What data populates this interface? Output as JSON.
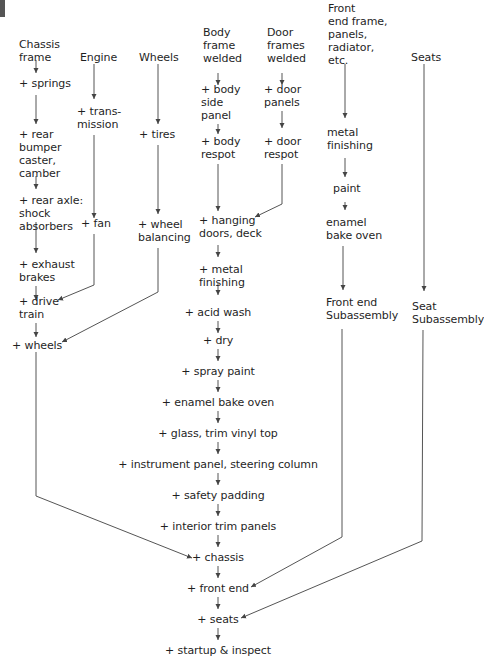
{
  "diagram": {
    "title_mark": "",
    "colors": {
      "line": "#555555",
      "text": "#1f1f1f",
      "background": "#ffffff"
    },
    "columns": {
      "chassis": {
        "header": "Chassis\nframe",
        "steps": [
          "+ springs",
          "+ rear\nbumper\ncaster,\ncamber",
          "+ rear axle:\nshock\nabsorbers",
          "+ exhaust\nbrakes",
          "+ drive\ntrain",
          "+ wheels"
        ]
      },
      "engine": {
        "header": "Engine",
        "steps": [
          "+ trans-\nmission",
          "+ fan"
        ]
      },
      "wheels": {
        "header": "Wheels",
        "steps": [
          "+ tires",
          "+ wheel\nbalancing"
        ]
      },
      "body": {
        "header": "Body\nframe\nwelded",
        "steps": [
          "+ body\nside\npanel",
          "+ body\nrespot"
        ]
      },
      "doors": {
        "header": "Door\nframes\nwelded",
        "steps": [
          "+ door\npanels",
          "+ door\nrespot"
        ]
      },
      "front_end": {
        "header": "Front\nend frame,\npanels,\nradiator,\netc.",
        "steps": [
          "metal\nfinishing",
          "paint",
          "enamel\nbake oven",
          "Front end\nSubassembly"
        ]
      },
      "seats": {
        "header": "Seats",
        "steps": [
          "Seat\nSubassembly"
        ]
      }
    },
    "main_line": [
      "+ hanging\ndoors, deck",
      "+ metal\nfinishing",
      "+ acid wash",
      "+ dry",
      "+ spray paint",
      "+ enamel bake oven",
      "+ glass, trim vinyl top",
      "+ instrument panel, steering column",
      "+ safety padding",
      "+ interior trim panels",
      "+ chassis",
      "+ front end",
      "+ seats",
      "+ startup & inspect"
    ]
  }
}
